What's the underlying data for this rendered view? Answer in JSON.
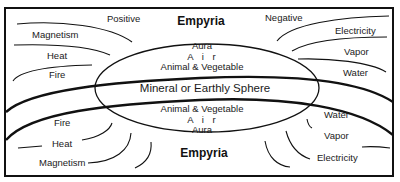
{
  "diagram": {
    "top_region": {
      "title": "Empyria",
      "left_labels": [
        "Positive",
        "Magnetism",
        "Heat",
        "Fire"
      ],
      "right_labels": [
        "Negative",
        "Electricity",
        "Vapor",
        "Water"
      ]
    },
    "center_ellipse": {
      "upper_layers": [
        "Aura",
        "A i r",
        "Animal & Vegetable"
      ],
      "core": "Mineral or Earthly Sphere",
      "lower_layers": [
        "Animal & Vegetable",
        "A i r",
        "Aura"
      ]
    },
    "bottom_region": {
      "title": "Empyria",
      "left_labels": [
        "Fire",
        "Heat",
        "Magnetism"
      ],
      "right_labels": [
        "Water",
        "Vapor",
        "Electricity"
      ]
    },
    "colors": {
      "line": "#111111",
      "background": "#ffffff"
    }
  }
}
